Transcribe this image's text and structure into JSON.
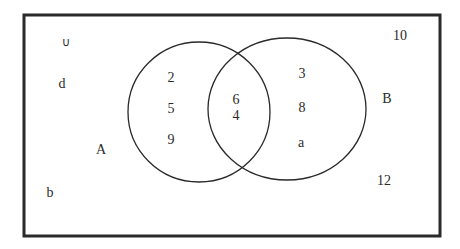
{
  "diagram": {
    "type": "venn",
    "universe": {
      "symbol": "∪",
      "elements_outside": [
        "d",
        "b",
        "10",
        "12"
      ]
    },
    "sets": [
      {
        "name": "A",
        "label": "A",
        "only_elements": [
          "2",
          "5",
          "9"
        ]
      },
      {
        "name": "B",
        "label": "B",
        "only_elements": [
          "3",
          "8",
          "a"
        ]
      }
    ],
    "intersection": {
      "sets": [
        "A",
        "B"
      ],
      "elements": [
        "6",
        "4"
      ]
    }
  },
  "labels": {
    "universe_symbol": "∪",
    "set_a": "A",
    "set_b": "B",
    "outside": {
      "d": "d",
      "b": "b",
      "ten": "10",
      "twelve": "12"
    },
    "a_only": [
      "2",
      "5",
      "9"
    ],
    "b_only": [
      "3",
      "8",
      "a"
    ],
    "both": [
      "6",
      "4"
    ]
  },
  "colors": {
    "stroke": "#2a2a2a",
    "background": "#ffffff",
    "text": "#2a2a2a"
  }
}
